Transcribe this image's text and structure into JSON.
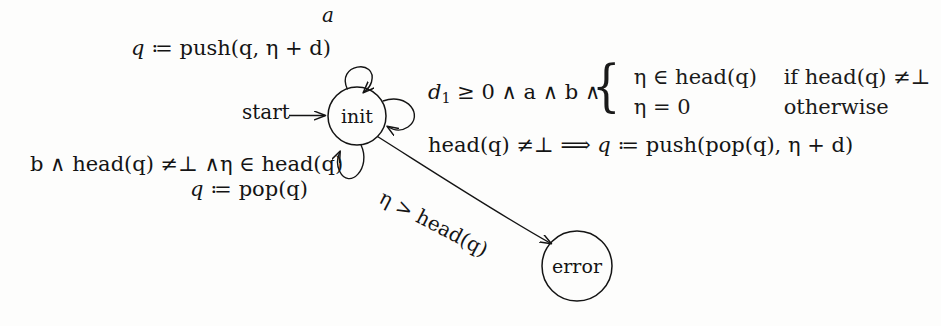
{
  "figure": {
    "type": "automaton-diagram",
    "background_color": "#fdfdfc",
    "ink_color": "#141414"
  },
  "states": [
    {
      "id": "init",
      "label": "init",
      "shape": "circle",
      "cx": 357,
      "cy": 116,
      "r": 29
    },
    {
      "id": "error",
      "label": "error",
      "shape": "circle",
      "cx": 577,
      "cy": 266,
      "r": 35
    }
  ],
  "start_marker": {
    "label": "start",
    "arrow": "⟶"
  },
  "transitions": {
    "top_self_loop": {
      "guard_label": "a",
      "update_prefix": "q",
      "assign_op": "≔",
      "update_expr": "push(q, η + d)"
    },
    "right_self_loop": {
      "guard": {
        "var": "d",
        "subscript": "1",
        "relation": "≥",
        "value": "0",
        "conjunction": "∧ a ∧ b ∧",
        "full_text": "d1 ≥ 0 ∧ a ∧ b ∧"
      },
      "cases": [
        {
          "expr": "η ∈ head(q)",
          "condition": "if head(q) ≠⊥"
        },
        {
          "expr": "η = 0",
          "condition": "otherwise"
        }
      ],
      "implication": {
        "antecedent": "head(q) ≠⊥",
        "arrow": "⟹",
        "consequent_var": "q",
        "assign_op": "≔",
        "consequent_expr": "push(pop(q), η + d)"
      }
    },
    "bottom_self_loop": {
      "guard": "b ∧ head(q) ≠⊥ ∧η ∈ head(q)",
      "update_prefix": "q",
      "assign_op": "≔",
      "update_expr": "pop(q)"
    },
    "init_to_error": {
      "label": "η > head(q)",
      "from": "init",
      "to": "error"
    }
  },
  "glyphs": {
    "assign": "≔",
    "neq": "≠",
    "bottom": "⊥",
    "and": "∧",
    "in": "∈",
    "geq": "≥",
    "gt": ">",
    "implies": "⟹",
    "eta": "η",
    "long_arrow": "⟶"
  }
}
